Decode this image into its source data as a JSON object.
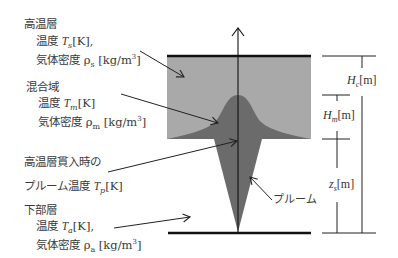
{
  "diagram": {
    "colors": {
      "upper_layer": "#a9a9a9",
      "plume": "#6b6b6b",
      "lines": "#111111",
      "text": "#3a3a3a"
    },
    "labels": {
      "upper_layer": {
        "title": "高温層",
        "temp_prefix": "温度 ",
        "temp_symbol": "T",
        "temp_sub": "s",
        "temp_unit": "[K],",
        "density_prefix": "気体密度 ",
        "density_symbol": "ρ",
        "density_sub": "s",
        "density_unit": " [kg/m",
        "density_exp": "3",
        "density_close": "]"
      },
      "mixing_zone": {
        "title": "混合域",
        "temp_prefix": "温度 ",
        "temp_symbol": "T",
        "temp_sub": "m",
        "temp_unit": "[K]",
        "density_prefix": "気体密度 ",
        "density_symbol": "ρ",
        "density_sub": "m",
        "density_unit": " [kg/m",
        "density_exp": "3",
        "density_close": "]"
      },
      "plume_temp": {
        "line1": "高温層貫入時の",
        "line2_prefix": "プルーム温度 ",
        "symbol": "T",
        "sub": "p",
        "unit": "[K]"
      },
      "lower_layer": {
        "title": "下部層",
        "temp_prefix": "温度 ",
        "temp_symbol": "T",
        "temp_sub": "a",
        "temp_unit": "[K],",
        "density_prefix": "気体密度 ",
        "density_symbol": "ρ",
        "density_sub": "a",
        "density_unit": " [kg/m",
        "density_exp": "3",
        "density_close": "]"
      },
      "plume": "プルーム"
    },
    "dimensions": {
      "Hc": {
        "symbol": "H",
        "sub": "c",
        "unit": "[m]"
      },
      "Hm": {
        "symbol": "H",
        "sub": "m",
        "unit": "[m]"
      },
      "zs": {
        "symbol": "z",
        "sub": "s",
        "unit": "[m]"
      }
    }
  }
}
